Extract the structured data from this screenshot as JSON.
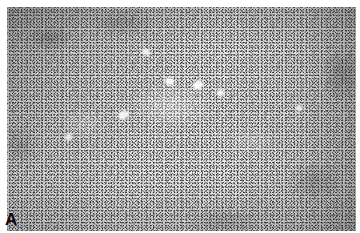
{
  "figure": {
    "domain": "natural-image",
    "kind": "histopathology micrograph",
    "panel_label": "A",
    "width_px": 360,
    "height_px": 233,
    "colors": {
      "paper": "#ffffff",
      "field_base": "#e6e6e6",
      "nuclei_dark": "#2e2e2e",
      "cleft_light": "#fbfbfb",
      "label": "#0b0b0b"
    },
    "appearance": {
      "palette": "grayscale",
      "plate_margin_px": 7,
      "description": "Dense monomorphous spindle-cell proliferation arranged in intersecting fascicles; fine dark nuclear stipple on pale eosinophilic background, darker at the upper-left and right margins, with a paler mid-field containing a few small bright clefts or capillary lumina.",
      "magnification_impression": "low to medium power"
    },
    "clefts": [
      {
        "name": "cleft-center-left",
        "left_pct": 32.0,
        "top_pct": 47.0,
        "width_px": 9,
        "height_px": 6,
        "rotate_deg": -28
      },
      {
        "name": "cleft-center-upper",
        "left_pct": 45.5,
        "top_pct": 32.0,
        "width_px": 7,
        "height_px": 5,
        "rotate_deg": 18
      },
      {
        "name": "cleft-center-right",
        "left_pct": 54.0,
        "top_pct": 33.0,
        "width_px": 6,
        "height_px": 8,
        "rotate_deg": 62
      },
      {
        "name": "cleft-right-mid",
        "left_pct": 60.5,
        "top_pct": 37.5,
        "width_px": 5,
        "height_px": 4,
        "rotate_deg": -12
      },
      {
        "name": "cleft-upper-mid",
        "left_pct": 39.0,
        "top_pct": 19.0,
        "width_px": 6,
        "height_px": 4,
        "rotate_deg": 34
      },
      {
        "name": "cleft-lower-left",
        "left_pct": 17.0,
        "top_pct": 57.0,
        "width_px": 5,
        "height_px": 4,
        "rotate_deg": -44
      },
      {
        "name": "cleft-far-right",
        "left_pct": 83.0,
        "top_pct": 44.0,
        "width_px": 4,
        "height_px": 4,
        "rotate_deg": 8
      }
    ]
  }
}
